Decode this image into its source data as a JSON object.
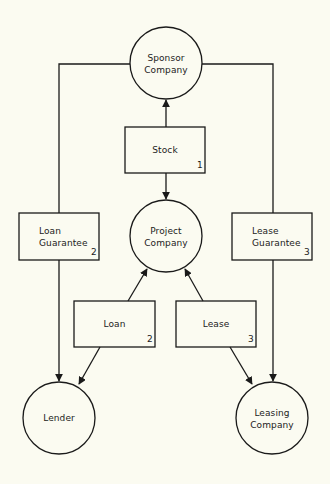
{
  "nodes": {
    "sponsor": {
      "line1": "Sponsor",
      "line2": "Company"
    },
    "project": {
      "line1": "Project",
      "line2": "Company"
    },
    "lender": {
      "label": "Lender"
    },
    "leasing": {
      "line1": "Leasing",
      "line2": "Company"
    }
  },
  "boxes": {
    "stock": {
      "label": "Stock",
      "number": "1"
    },
    "loan_guarantee": {
      "line1": "Loan",
      "line2": "Guarantee",
      "number": "2"
    },
    "lease_guarantee": {
      "line1": "Lease",
      "line2": "Guarantee",
      "number": "3"
    },
    "loan": {
      "label": "Loan",
      "number": "2"
    },
    "lease": {
      "label": "Lease",
      "number": "3"
    }
  },
  "colors": {
    "background": "#fbfbf1",
    "stroke": "#1a1a1a"
  }
}
